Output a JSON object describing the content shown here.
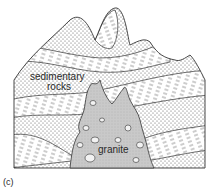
{
  "figure": {
    "panel_label": "(c)",
    "labels": {
      "sedimentary_line1": "sedimentary",
      "sedimentary_line2": "rocks",
      "granite": "granite"
    }
  },
  "colors": {
    "outline": "#333333",
    "dots": "#555555",
    "dashes": "#555555",
    "granite_fill": "#c9c9c9",
    "background": "#ffffff"
  },
  "legend_semantics": {
    "dotted_layer": "sandstone-like sedimentary strata",
    "dashed_layer": "shale-like sedimentary strata",
    "grey_body": "granite intrusion with xenoliths"
  }
}
